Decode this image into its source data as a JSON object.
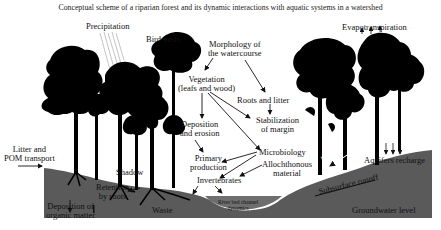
{
  "title": "Conceptual scheme of a riparian forest and its dynamic interactions with aquatic systems in a watershed",
  "colors": {
    "ground": "#5a5a5a",
    "channel": "#6b6b6b",
    "tree": "#000000",
    "background": "#ffffff",
    "text": "#111111"
  },
  "labels": {
    "precipitation": "Precipitation",
    "bird_nests": "Bird nests",
    "morphology_1": "Morphology of",
    "morphology_2": "the watercourse",
    "vegetation_1": "Vegetation",
    "vegetation_2": "(leafs and wood)",
    "roots_litter": "Roots and litter",
    "stabilization_1": "Stabilization",
    "stabilization_2": "of margin",
    "deposition_erosion_1": "Deposition",
    "deposition_erosion_2": "and erosion",
    "microbiology": "Microbiology",
    "primary_production_1": "Primary",
    "primary_production_2": "production",
    "allochthonous_1": "Allochthonous",
    "allochthonous_2": "material",
    "invertebrates": "Invertebrates",
    "litter_pom_1": "Litter and",
    "litter_pom_2": "POM transport",
    "shadow": "Shadow",
    "retention_1": "Retention",
    "retention_2": "by roots",
    "deposition_organic_1": "Deposition of",
    "deposition_organic_2": "organic matter",
    "waste": "Waste",
    "river_bed_1": "River bed channel",
    "river_bed_2": "dynamics",
    "evapotranspiration": "Evapotranspiration",
    "runoff": "Runoff",
    "aquifers_recharge": "Aquifers recharge",
    "subsurface_runoff": "Subsurface runoff",
    "groundwater_level": "Groundwater level"
  }
}
